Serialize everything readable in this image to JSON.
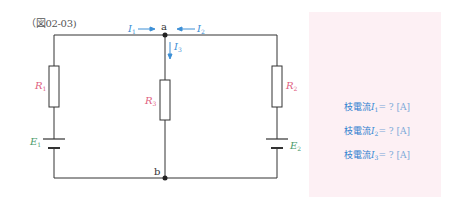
{
  "figure": {
    "label": "（図02-03)"
  },
  "nodes": {
    "a": "a",
    "b": "b"
  },
  "currents": {
    "i1": {
      "symbol": "I",
      "sub": "1"
    },
    "i2": {
      "symbol": "I",
      "sub": "2"
    },
    "i3": {
      "symbol": "I",
      "sub": "3"
    }
  },
  "components": {
    "r1": {
      "symbol": "R",
      "sub": "1"
    },
    "r2": {
      "symbol": "R",
      "sub": "2"
    },
    "r3": {
      "symbol": "R",
      "sub": "3"
    },
    "e1": {
      "symbol": "E",
      "sub": "1"
    },
    "e2": {
      "symbol": "E",
      "sub": "2"
    }
  },
  "answers": [
    {
      "prefix": "枝電流",
      "symbol": "I",
      "sub": "1",
      "suffix": "= ? [A]"
    },
    {
      "prefix": "枝電流",
      "symbol": "I",
      "sub": "2",
      "suffix": "= ? [A]"
    },
    {
      "prefix": "枝電流",
      "symbol": "I",
      "sub": "3",
      "suffix": "= ? [A]"
    }
  ],
  "colors": {
    "wire": "#333333",
    "resistor_label": "#e06080",
    "source_label": "#4a9a6a",
    "current": "#3c8fd6",
    "panel_bg": "#fdf0f4"
  }
}
